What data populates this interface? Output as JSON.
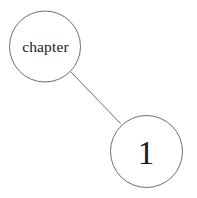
{
  "diagram": {
    "type": "node-link-diagram",
    "background_color": "#ffffff",
    "stroke_color": "#6e6e70",
    "text_color": "#1a1a1a",
    "nodes": [
      {
        "id": "node-chapter",
        "label": "chapter",
        "cx": 45,
        "cy": 46.5,
        "r": 35.5,
        "stroke_width": 1.0,
        "label_x": 45.5,
        "label_y": 52,
        "font_size": 15.5
      },
      {
        "id": "node-number",
        "label": "1",
        "cx": 146.5,
        "cy": 151.5,
        "r": 36.0,
        "stroke_width": 1.0,
        "label_x": 146,
        "label_y": 164,
        "font_size": 33
      }
    ],
    "edges": [
      {
        "id": "edge-chapter-to-number",
        "from": "node-chapter",
        "to": "node-number",
        "x1": 71,
        "y1": 72,
        "x2": 120.5,
        "y2": 123.5,
        "stroke_width": 1.0
      }
    ]
  }
}
